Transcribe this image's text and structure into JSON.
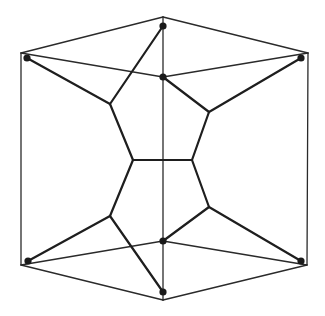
{
  "diagram": {
    "type": "graph-drawing",
    "colors": {
      "background": "#ffffff",
      "stroke": "#1e1e1e",
      "vertex": "#1a1a1a"
    },
    "frame_edges": [
      {
        "from": [
          21,
          53
        ],
        "to": [
          163,
          17
        ]
      },
      {
        "from": [
          163,
          17
        ],
        "to": [
          308,
          53
        ]
      },
      {
        "from": [
          21,
          53
        ],
        "to": [
          21,
          265
        ]
      },
      {
        "from": [
          308,
          53
        ],
        "to": [
          307,
          265
        ]
      },
      {
        "from": [
          21,
          265
        ],
        "to": [
          163,
          300
        ]
      },
      {
        "from": [
          163,
          300
        ],
        "to": [
          307,
          265
        ]
      },
      {
        "from": [
          163,
          17
        ],
        "to": [
          163,
          300
        ]
      },
      {
        "from": [
          21,
          53
        ],
        "to": [
          163,
          77
        ]
      },
      {
        "from": [
          163,
          77
        ],
        "to": [
          308,
          53
        ]
      },
      {
        "from": [
          21,
          265
        ],
        "to": [
          163,
          241
        ]
      },
      {
        "from": [
          163,
          241
        ],
        "to": [
          307,
          265
        ]
      }
    ],
    "inner_edges": [
      {
        "from": [
          27,
          58
        ],
        "to": [
          110,
          104
        ]
      },
      {
        "from": [
          163,
          26
        ],
        "to": [
          110,
          104
        ]
      },
      {
        "from": [
          110,
          104
        ],
        "to": [
          133,
          160
        ]
      },
      {
        "from": [
          163,
          77
        ],
        "to": [
          209,
          112
        ]
      },
      {
        "from": [
          301,
          58
        ],
        "to": [
          209,
          112
        ]
      },
      {
        "from": [
          209,
          112
        ],
        "to": [
          192,
          160
        ]
      },
      {
        "from": [
          133,
          160
        ],
        "to": [
          192,
          160
        ]
      },
      {
        "from": [
          133,
          160
        ],
        "to": [
          110,
          216
        ]
      },
      {
        "from": [
          110,
          216
        ],
        "to": [
          28,
          261
        ]
      },
      {
        "from": [
          110,
          216
        ],
        "to": [
          163,
          292
        ]
      },
      {
        "from": [
          192,
          160
        ],
        "to": [
          209,
          207
        ]
      },
      {
        "from": [
          209,
          207
        ],
        "to": [
          163,
          241
        ]
      },
      {
        "from": [
          209,
          207
        ],
        "to": [
          301,
          261
        ]
      }
    ],
    "vertices": [
      {
        "id": "top",
        "x": 163,
        "y": 26
      },
      {
        "id": "upper-inner",
        "x": 163,
        "y": 77
      },
      {
        "id": "left-upper",
        "x": 27,
        "y": 58
      },
      {
        "id": "right-upper",
        "x": 301,
        "y": 58
      },
      {
        "id": "left-lower",
        "x": 28,
        "y": 261
      },
      {
        "id": "right-lower",
        "x": 301,
        "y": 261
      },
      {
        "id": "lower-inner",
        "x": 163,
        "y": 241
      },
      {
        "id": "bottom",
        "x": 163,
        "y": 292
      }
    ]
  }
}
